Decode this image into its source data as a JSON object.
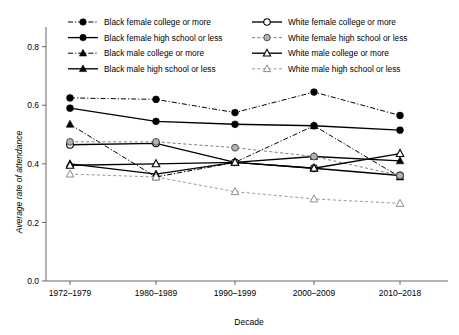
{
  "chart_data": {
    "type": "line",
    "title": "",
    "xlabel": "Decade",
    "ylabel": "Average rate of attendance",
    "categories": [
      "1972–1979",
      "1980–1989",
      "1990–1999",
      "2000–2009",
      "2010–2018"
    ],
    "ylim": [
      0.0,
      0.85
    ],
    "yticks": [
      "0.0",
      "0.2",
      "0.4",
      "0.6",
      "0.8"
    ],
    "ytick_values": [
      0.0,
      0.2,
      0.4,
      0.6,
      0.8
    ],
    "grid": false,
    "legend_position": "top",
    "series": [
      {
        "name": "Black female college or more",
        "color": "#000000",
        "marker": "filled-circle",
        "line": "dash-dot",
        "values": [
          0.625,
          0.62,
          0.575,
          0.645,
          0.565
        ]
      },
      {
        "name": "Black female high school or less",
        "color": "#000000",
        "marker": "filled-circle",
        "line": "solid",
        "values": [
          0.59,
          0.545,
          0.535,
          0.53,
          0.515
        ]
      },
      {
        "name": "Black male college or more",
        "color": "#000000",
        "marker": "filled-triangle",
        "line": "dash-dot",
        "values": [
          0.535,
          0.355,
          0.405,
          0.53,
          0.355
        ]
      },
      {
        "name": "Black male high school or less",
        "color": "#000000",
        "marker": "filled-triangle",
        "line": "solid",
        "values": [
          0.4,
          0.365,
          0.405,
          0.425,
          0.41
        ]
      },
      {
        "name": "White female college or more",
        "color": "#000000",
        "marker": "open-circle",
        "line": "solid",
        "values": [
          0.465,
          0.47,
          0.405,
          0.385,
          0.36
        ]
      },
      {
        "name": "White female high school or less",
        "color": "#7f7f7f",
        "marker": "gray-circle",
        "line": "dashed",
        "values": [
          0.475,
          0.475,
          0.455,
          0.425,
          0.36
        ]
      },
      {
        "name": "White male college or more",
        "color": "#000000",
        "marker": "open-triangle",
        "line": "solid",
        "values": [
          0.395,
          0.4,
          0.405,
          0.385,
          0.435
        ]
      },
      {
        "name": "White male high school or less",
        "color": "#9a9a9a",
        "marker": "open-gray-triangle",
        "line": "dashed",
        "values": [
          0.365,
          0.355,
          0.305,
          0.28,
          0.265
        ]
      }
    ]
  },
  "legend": {
    "items": [
      {
        "label": "Black female college or more"
      },
      {
        "label": "White female college or more"
      },
      {
        "label": "Black female high school or less"
      },
      {
        "label": "White female high school or less"
      },
      {
        "label": "Black male college or more"
      },
      {
        "label": "White male college or more"
      },
      {
        "label": "Black male high school or less"
      },
      {
        "label": "White male high school or less"
      }
    ]
  }
}
